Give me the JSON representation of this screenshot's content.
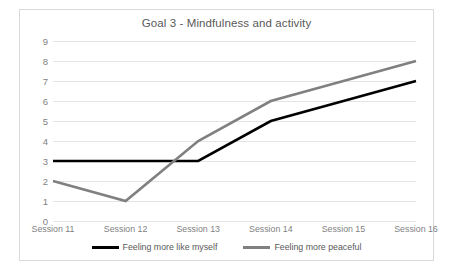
{
  "chart_data": {
    "type": "line",
    "title": "Goal 3 - Mindfulness and activity",
    "xlabel": "",
    "ylabel": "",
    "categories": [
      "Session 11",
      "Session 12",
      "Session 13",
      "Session 14",
      "Session 15",
      "Session 16"
    ],
    "ylim": [
      0,
      9
    ],
    "yticks": [
      0,
      1,
      2,
      3,
      4,
      5,
      6,
      7,
      8,
      9
    ],
    "grid": true,
    "legend_position": "bottom",
    "series": [
      {
        "name": "Feeling more like myself",
        "color": "#000000",
        "values": [
          3,
          3,
          3,
          5,
          6,
          7
        ]
      },
      {
        "name": "Feeling more peaceful",
        "color": "#808080",
        "values": [
          2,
          1,
          4,
          6,
          7,
          8
        ]
      }
    ]
  },
  "style": {
    "axis_text_color": "#7f7f7f",
    "title_color": "#595959",
    "gridline_color": "#e4e4e4",
    "border_color": "#d9d9d9",
    "background": "#ffffff"
  }
}
